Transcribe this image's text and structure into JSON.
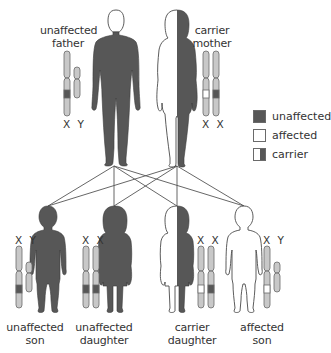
{
  "colors": {
    "unaffected": "#575757",
    "affected": "#ffffff",
    "chromosome": "#c8c8c8",
    "outline": "#4a4a4a",
    "line": "#555555"
  },
  "parents": {
    "father": {
      "label_line1": "unaffected",
      "label_line2": "father",
      "chromosomes_label": "X Y",
      "status": "unaffected"
    },
    "mother": {
      "label_line1": "carrier",
      "label_line2": "mother",
      "chromosomes_label": "X X",
      "status": "carrier"
    }
  },
  "children": [
    {
      "label_line1": "unaffected",
      "label_line2": "son",
      "chromosomes_label": "X Y",
      "status": "unaffected"
    },
    {
      "label_line1": "unaffected",
      "label_line2": "daughter",
      "chromosomes_label": "X X",
      "status": "unaffected"
    },
    {
      "label_line1": "carrier",
      "label_line2": "daughter",
      "chromosomes_label": "X X",
      "status": "carrier"
    },
    {
      "label_line1": "affected",
      "label_line2": "son",
      "chromosomes_label": "X Y",
      "status": "affected"
    }
  ],
  "legend": [
    {
      "key": "unaffected",
      "label": "unaffected"
    },
    {
      "key": "affected",
      "label": "affected"
    },
    {
      "key": "carrier",
      "label": "carrier"
    }
  ]
}
